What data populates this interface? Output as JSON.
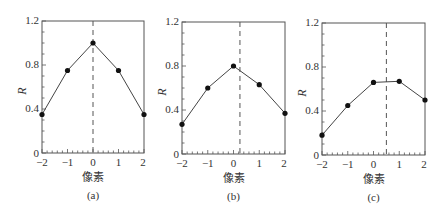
{
  "chart_data": [
    {
      "type": "line",
      "panel": "(a)",
      "x": [
        -2,
        -1,
        0,
        1,
        2
      ],
      "values": [
        0.35,
        0.75,
        1.0,
        0.75,
        0.35
      ],
      "xlabel": "像素",
      "ylabel": "R",
      "xlim": [
        -2,
        2
      ],
      "ylim": [
        0,
        1.2
      ],
      "yticks": [
        "0",
        "0.4",
        "0.8",
        "1.2"
      ],
      "xticks": [
        "−2",
        "−1",
        "0",
        "1",
        "2"
      ],
      "dashed_vline_x": 0,
      "grid": false,
      "caption": "(a)"
    },
    {
      "type": "line",
      "panel": "(b)",
      "x": [
        -2,
        -1,
        0,
        1,
        2
      ],
      "values": [
        0.27,
        0.6,
        0.8,
        0.63,
        0.37
      ],
      "xlabel": "像素",
      "ylabel": "R",
      "xlim": [
        -2,
        2
      ],
      "ylim": [
        0,
        1.2
      ],
      "yticks": [
        "0",
        "0.4",
        "0.8",
        "1.2"
      ],
      "xticks": [
        "−2",
        "−1",
        "0",
        "1",
        "2"
      ],
      "dashed_vline_x": 0.25,
      "grid": false,
      "caption": "(b)"
    },
    {
      "type": "line",
      "panel": "(c)",
      "x": [
        -2,
        -1,
        0,
        1,
        2
      ],
      "values": [
        0.18,
        0.45,
        0.66,
        0.67,
        0.5
      ],
      "xlabel": "像素",
      "ylabel": "R",
      "xlim": [
        -2,
        2
      ],
      "ylim": [
        0,
        1.2
      ],
      "yticks": [
        "0",
        "0.4",
        "0.8",
        "1.2"
      ],
      "xticks": [
        "−2",
        "−1",
        "0",
        "1",
        "2"
      ],
      "dashed_vline_x": 0.5,
      "grid": false,
      "caption": "(c)"
    }
  ],
  "panels": [
    {
      "ylabel": "R",
      "xlabel": "像素",
      "caption": "(a)",
      "y0": "0",
      "y1": "0.4",
      "y2": "0.8",
      "y3": "1.2",
      "xm2": "−2",
      "xm1": "−1",
      "x0": "0",
      "x1": "1",
      "x2": "2"
    },
    {
      "ylabel": "R",
      "xlabel": "像素",
      "caption": "(b)",
      "y0": "0",
      "y1": "0.4",
      "y2": "0.8",
      "y3": "1.2",
      "xm2": "−2",
      "xm1": "−1",
      "x0": "0",
      "x1": "1",
      "x2": "2"
    },
    {
      "ylabel": "R",
      "xlabel": "像素",
      "caption": "(c)",
      "y0": "0",
      "y1": "0.4",
      "y2": "0.8",
      "y3": "1.2",
      "xm2": "−2",
      "xm1": "−1",
      "x0": "0",
      "x1": "1",
      "x2": "2"
    }
  ],
  "colors": {
    "axis": "#555555",
    "line": "#444444",
    "marker": "#111111"
  }
}
